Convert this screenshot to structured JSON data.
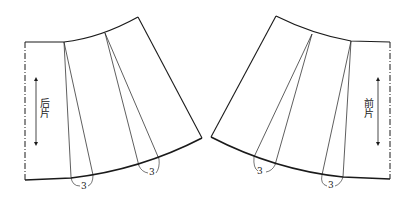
{
  "diagram": {
    "type": "sewing-pattern",
    "colors": {
      "line": "#1a1a1a",
      "background": "#ffffff"
    },
    "pieces": [
      {
        "id": "back",
        "label": "后片",
        "label_meaning": "back piece",
        "fold_edge": "left (dash-dot)",
        "grainline": "vertical double arrow",
        "darts": [
          {
            "measurement": "3"
          },
          {
            "measurement": "3"
          }
        ]
      },
      {
        "id": "front",
        "label": "前片",
        "label_meaning": "front piece",
        "fold_edge": "right (dash-dot)",
        "grainline": "vertical double arrow",
        "darts": [
          {
            "measurement": "3"
          },
          {
            "measurement": "3"
          }
        ]
      }
    ]
  }
}
